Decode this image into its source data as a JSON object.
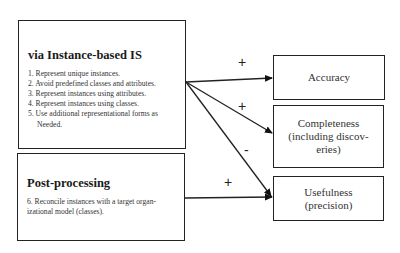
{
  "left_boxes": {
    "instance_based": {
      "title": "via Instance-based IS",
      "items": [
        "1. Represent unique instances.",
        "2. Avoid predefined classes and attributes.",
        "3. Represent instances using attributes.",
        "4. Represent instances using classes.",
        "5. Use additional representational forms as",
        "Needed."
      ]
    },
    "post_processing": {
      "title": "Post-processing",
      "items": [
        "6. Reconcile instances with a target organ-",
        "izational model (classes)."
      ]
    }
  },
  "outcomes": [
    {
      "lines": [
        "Accuracy"
      ]
    },
    {
      "lines": [
        "Completeness",
        "(including discov-",
        "eries)"
      ]
    },
    {
      "lines": [
        "Usefulness",
        "(precision)"
      ]
    }
  ],
  "edges": [
    {
      "from": "instance_based",
      "to": "Accuracy",
      "sign": "+"
    },
    {
      "from": "instance_based",
      "to": "Completeness",
      "sign": "+"
    },
    {
      "from": "instance_based",
      "to": "Usefulness",
      "sign": "-"
    },
    {
      "from": "post_processing",
      "to": "Usefulness",
      "sign": "+"
    }
  ]
}
